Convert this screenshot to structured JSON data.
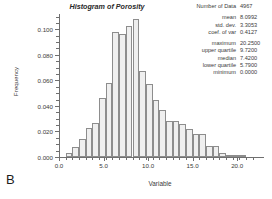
{
  "panel": {
    "letter": "B"
  },
  "chart_data": {
    "type": "bar",
    "title": "Histogram of Porosity",
    "xlabel": "Variable",
    "ylabel": "Frequency",
    "xlim": [
      0.0,
      22.0
    ],
    "ylim": [
      0.0,
      0.112
    ],
    "grid": false,
    "legend": null,
    "xticks": [
      "0.0",
      "5.0",
      "10.0",
      "15.0",
      "20.0"
    ],
    "xtick_values": [
      0.0,
      5.0,
      10.0,
      15.0,
      20.0
    ],
    "yticks": [
      "0.000",
      "0.020",
      "0.040",
      "0.060",
      "0.080",
      "0.100"
    ],
    "ytick_values": [
      0.0,
      0.02,
      0.04,
      0.06,
      0.08,
      0.1
    ],
    "bin_width": 0.75,
    "bin_starts": [
      0.75,
      1.5,
      2.25,
      3.0,
      3.75,
      4.5,
      5.25,
      6.0,
      6.75,
      7.5,
      8.25,
      9.0,
      9.75,
      10.5,
      11.25,
      12.0,
      12.75,
      13.5,
      14.25,
      15.0,
      15.75,
      16.5,
      17.25,
      18.0,
      18.75,
      19.5,
      20.25
    ],
    "categories": [
      "0.75",
      "1.50",
      "2.25",
      "3.00",
      "3.75",
      "4.50",
      "5.25",
      "6.00",
      "6.75",
      "7.50",
      "8.25",
      "9.00",
      "9.75",
      "10.50",
      "11.25",
      "12.00",
      "12.75",
      "13.50",
      "14.25",
      "15.00",
      "15.75",
      "16.50",
      "17.25",
      "18.00",
      "18.75",
      "19.50",
      "20.25"
    ],
    "values": [
      0.003,
      0.008,
      0.014,
      0.023,
      0.027,
      0.046,
      0.058,
      0.098,
      0.096,
      0.103,
      0.108,
      0.067,
      0.057,
      0.045,
      0.037,
      0.028,
      0.028,
      0.026,
      0.022,
      0.018,
      0.018,
      0.009,
      0.009,
      0.003,
      0.001,
      0.0005,
      0.0003
    ]
  },
  "stats": {
    "count_label": "Number of Data",
    "count_value": "4967",
    "group1": [
      {
        "label": "mean",
        "value": "8.0992"
      },
      {
        "label": "std. dev.",
        "value": "3.3053"
      },
      {
        "label": "coef. of var",
        "value": "0.4127"
      }
    ],
    "group2": [
      {
        "label": "maximum",
        "value": "20.2500"
      },
      {
        "label": "upper quartile",
        "value": "9.7200"
      },
      {
        "label": "median",
        "value": "7.4200"
      },
      {
        "label": "lower quartile",
        "value": "5.7900"
      },
      {
        "label": "minimum",
        "value": "0.0000"
      }
    ]
  }
}
